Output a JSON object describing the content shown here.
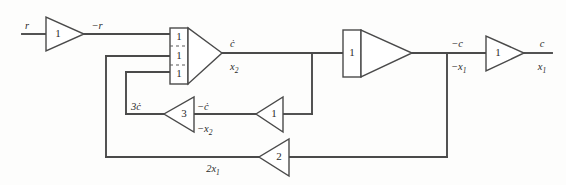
{
  "diagram": {
    "type": "signal-flow-block-diagram",
    "colors": {
      "wire": "#4a4a4a",
      "outline": "#4a4a4a",
      "text": "#2b2b2b",
      "background": "#fdfdfc"
    },
    "input_signal": "r",
    "output_signal": "c",
    "blocks": {
      "input_amp": {
        "gain": "1",
        "name": "input-inverter"
      },
      "summer": {
        "gain_1": "1",
        "gain_2": "1",
        "gain_3": "1",
        "name": "summing-integrator"
      },
      "integrator2": {
        "gain": "1",
        "name": "second-integrator"
      },
      "output_amp": {
        "gain": "1",
        "name": "output-inverter"
      },
      "feedback_amp_3": {
        "gain": "3",
        "name": "velocity-feedback-gain"
      },
      "feedback_amp_1": {
        "gain": "1",
        "name": "velocity-inverter"
      },
      "feedback_amp_2": {
        "gain": "2",
        "name": "position-feedback-gain"
      }
    },
    "signals": {
      "input_r": "r",
      "after_input_amp": "−r",
      "summer_out_top": "ċ",
      "summer_out_bottom": "x",
      "summer_out_bottom_sub": "2",
      "integrator2_out_top": "−c",
      "integrator2_out_bottom": "−x",
      "integrator2_out_bottom_sub": "1",
      "final_out_top": "c",
      "final_out_bottom": "x",
      "final_out_bottom_sub": "1",
      "feedback3_in": "3ċ",
      "feedback3_out_top": "−ċ",
      "feedback3_out_bottom": "−x",
      "feedback3_out_bottom_sub": "2",
      "feedback2_out": "2x",
      "feedback2_out_sub": "1"
    }
  }
}
